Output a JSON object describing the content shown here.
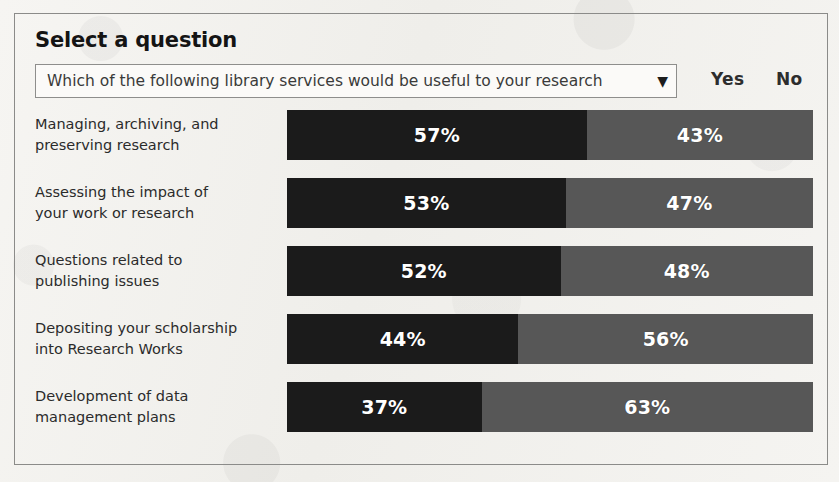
{
  "panel": {
    "heading": "Select a question"
  },
  "question_selector": {
    "name": "question-dropdown",
    "selected_value": "Which of the following library services would be useful to your research",
    "caret_glyph": "▼"
  },
  "legend": {
    "yes_label": "Yes",
    "no_label": "No",
    "yes_color": "#1b1b1b",
    "no_color": "#575757"
  },
  "chart_data": {
    "type": "bar",
    "orientation": "horizontal",
    "stacked": true,
    "normalized_to_100": true,
    "title": "Which of the following library services would be useful to your research",
    "xlabel": "",
    "ylabel": "",
    "xlim": [
      0,
      100
    ],
    "grid": false,
    "legend_position": "top-right",
    "value_suffix": "%",
    "categories": [
      "Managing, archiving, and preserving research",
      "Assessing the impact of your work or research",
      "Questions related to publishing issues",
      "Depositing your scholarship into Research Works",
      "Development of data management plans"
    ],
    "series": [
      {
        "name": "Yes",
        "color": "#1b1b1b",
        "values": [
          57,
          53,
          52,
          44,
          37
        ]
      },
      {
        "name": "No",
        "color": "#575757",
        "values": [
          43,
          47,
          48,
          56,
          63
        ]
      }
    ]
  },
  "rows": [
    {
      "label_line1": "Managing, archiving, and",
      "label_line2": "preserving research",
      "yes_value": 57,
      "no_value": 43,
      "yes_text": "57%",
      "no_text": "43%"
    },
    {
      "label_line1": "Assessing the impact of",
      "label_line2": "your work or research",
      "yes_value": 53,
      "no_value": 47,
      "yes_text": "53%",
      "no_text": "47%"
    },
    {
      "label_line1": "Questions related to",
      "label_line2": "publishing issues",
      "yes_value": 52,
      "no_value": 48,
      "yes_text": "52%",
      "no_text": "48%"
    },
    {
      "label_line1": "Depositing your scholarship",
      "label_line2": "into Research Works",
      "yes_value": 44,
      "no_value": 56,
      "yes_text": "44%",
      "no_text": "56%"
    },
    {
      "label_line1": "Development of data",
      "label_line2": "management plans",
      "yes_value": 37,
      "no_value": 63,
      "yes_text": "37%",
      "no_text": "63%"
    }
  ]
}
